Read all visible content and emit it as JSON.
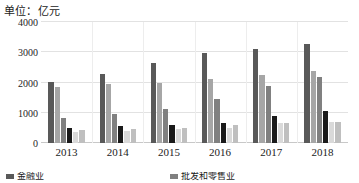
{
  "caption": "单位：亿元",
  "chart_data": {
    "type": "bar",
    "title": "",
    "subtitle": "",
    "unit_note": "单位：亿元",
    "xlabel": "",
    "ylabel": "",
    "ylim": [
      0,
      4000
    ],
    "yticks": [
      0,
      1000,
      2000,
      3000,
      4000
    ],
    "ytick_labels": [
      "0",
      "1000",
      "2000",
      "3000",
      "4000"
    ],
    "grid": true,
    "legend_position": "bottom",
    "categories": [
      "2013",
      "2014",
      "2015",
      "2016",
      "2017",
      "2018"
    ],
    "series": [
      {
        "name": "金融业",
        "color": "#595959",
        "values": [
          2020,
          2290,
          2630,
          2980,
          3120,
          3280
        ]
      },
      {
        "name": "series-2",
        "color": "#a6a6a6",
        "values": [
          1850,
          1950,
          1970,
          2110,
          2250,
          2390
        ]
      },
      {
        "name": "批发和零售业",
        "color": "#808080",
        "values": [
          840,
          960,
          1140,
          1460,
          1880,
          2190
        ]
      },
      {
        "name": "series-4",
        "color": "#1a1a1a",
        "values": [
          490,
          550,
          590,
          650,
          900,
          1060
        ]
      },
      {
        "name": "series-5",
        "color": "#d9d9d9",
        "values": [
          350,
          400,
          450,
          490,
          650,
          690
        ]
      },
      {
        "name": "series-6",
        "color": "#bfbfbf",
        "values": [
          440,
          470,
          510,
          580,
          660,
          700
        ]
      }
    ]
  },
  "legend": {
    "items": [
      {
        "label": "金融业",
        "color": "#595959"
      },
      {
        "label": "批发和零售业",
        "color": "#808080"
      }
    ]
  }
}
